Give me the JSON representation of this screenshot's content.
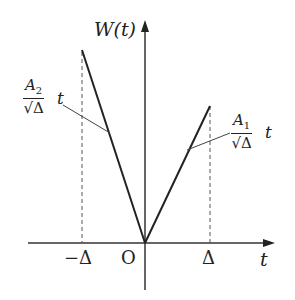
{
  "diagram": {
    "y_axis_label": "W(t)",
    "x_axis_label": "t",
    "origin_label": "O",
    "tick_neg_delta": "−Δ",
    "tick_pos_delta": "Δ",
    "left_slope": {
      "num_var": "A",
      "num_sub": "2",
      "den": "√Δ",
      "var": "t"
    },
    "right_slope": {
      "num_var": "A",
      "num_sub": "1",
      "den": "√Δ",
      "var": "t"
    }
  }
}
